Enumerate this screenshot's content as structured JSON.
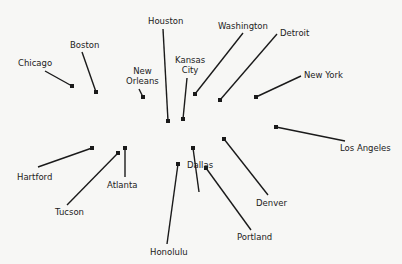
{
  "diagram": {
    "type": "labeled point scatter (cities)",
    "colors": {
      "background": "#f7f7f5",
      "ink": "#1a1a1a"
    },
    "cities": [
      {
        "name": "Chicago",
        "marker": [
          72,
          86
        ],
        "label_xy": [
          18,
          58
        ],
        "line_end": [
          45,
          71
        ]
      },
      {
        "name": "Boston",
        "marker": [
          96,
          92
        ],
        "label_xy": [
          70,
          40
        ],
        "line_end": [
          82,
          52
        ]
      },
      {
        "name": "New Orleans",
        "marker": [
          143,
          97
        ],
        "label_xy": [
          126,
          66
        ],
        "line_end": [
          139,
          89
        ]
      },
      {
        "name": "Houston",
        "marker": [
          168,
          121
        ],
        "label_xy": [
          148,
          16
        ],
        "line_end": [
          163,
          29
        ]
      },
      {
        "name": "Kansas City",
        "marker": [
          183,
          119
        ],
        "label_xy": [
          175,
          55
        ],
        "line_end": [
          187,
          78
        ]
      },
      {
        "name": "Washington",
        "marker": [
          195,
          94
        ],
        "label_xy": [
          218,
          21
        ],
        "line_end": [
          243,
          33
        ]
      },
      {
        "name": "Detroit",
        "marker": [
          220,
          100
        ],
        "label_xy": [
          280,
          28
        ],
        "line_end": [
          277,
          34
        ]
      },
      {
        "name": "New York",
        "marker": [
          256,
          97
        ],
        "label_xy": [
          304,
          70
        ],
        "line_end": [
          301,
          76
        ]
      },
      {
        "name": "Los Angeles",
        "marker": [
          276,
          127
        ],
        "label_xy": [
          340,
          143
        ],
        "line_end": [
          345,
          141
        ]
      },
      {
        "name": "Hartford",
        "marker": [
          92,
          148
        ],
        "label_xy": [
          17,
          172
        ],
        "line_end": [
          38,
          167
        ]
      },
      {
        "name": "Tucson",
        "marker": [
          118,
          153
        ],
        "label_xy": [
          55,
          207
        ],
        "line_end": [
          67,
          205
        ]
      },
      {
        "name": "Atlanta",
        "marker": [
          125,
          148
        ],
        "label_xy": [
          107,
          180
        ],
        "line_end": [
          125,
          177
        ]
      },
      {
        "name": "Honolulu",
        "marker": [
          178,
          164
        ],
        "label_xy": [
          150,
          247
        ],
        "line_end": [
          167,
          244
        ]
      },
      {
        "name": "Dallas",
        "marker": [
          193,
          148
        ],
        "label_xy": [
          187,
          160
        ],
        "line_end": [
          199,
          192
        ]
      },
      {
        "name": "Denver",
        "marker": [
          224,
          139
        ],
        "label_xy": [
          256,
          198
        ],
        "line_end": [
          268,
          195
        ]
      },
      {
        "name": "Portland",
        "marker": [
          206,
          168
        ],
        "label_xy": [
          237,
          232
        ],
        "line_end": [
          251,
          230
        ]
      }
    ]
  }
}
